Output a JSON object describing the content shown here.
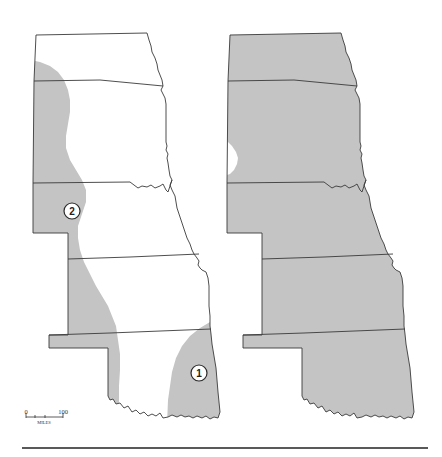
{
  "figure": {
    "colors": {
      "shade": "#c4c4c4",
      "background": "#ffffff",
      "outline": "#3a3a3a",
      "rule": "#222222"
    }
  },
  "left_map": {
    "regions": [
      {
        "id": "1",
        "label": "1"
      },
      {
        "id": "2",
        "label": "2"
      }
    ]
  },
  "right_map": {
    "note": "Nearly entire region shaded except small notch on western South Dakota"
  },
  "scale_bar": {
    "start_label": "0",
    "end_label": "100",
    "unit_label": "MILES"
  }
}
